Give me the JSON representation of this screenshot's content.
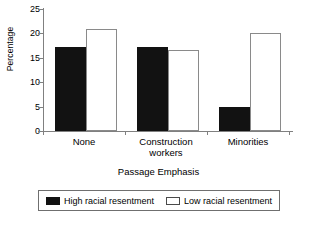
{
  "chart_data": {
    "type": "bar",
    "title": "",
    "xlabel": "Passage Emphasis",
    "ylabel": "Percentage",
    "categories": [
      "None",
      "Construction\nworkers",
      "Minorities"
    ],
    "category_labels_flat": [
      "None",
      "Construction workers",
      "Minorities"
    ],
    "series": [
      {
        "name": "High racial resentment",
        "color": "#121212",
        "values": [
          17.2,
          17.3,
          5.0
        ]
      },
      {
        "name": "Low racial resentment",
        "color": "#ffffff",
        "values": [
          21.0,
          16.5,
          20.0
        ]
      }
    ],
    "ylim": [
      0,
      25
    ],
    "ytick_values": [
      0,
      5,
      10,
      15,
      20,
      25
    ],
    "ytick_labels": [
      "0",
      "5",
      "10",
      "15",
      "20",
      "25"
    ],
    "grid": false,
    "legend_position": "bottom"
  },
  "axis": {
    "y_title": "Percentage",
    "x_title": "Passage Emphasis",
    "yticks": [
      "25",
      "20",
      "15",
      "10",
      "5",
      "0"
    ]
  },
  "legend": {
    "entries": [
      {
        "label": "High racial resentment",
        "swatch": "dark"
      },
      {
        "label": "Low racial resentment",
        "swatch": "light"
      }
    ]
  }
}
